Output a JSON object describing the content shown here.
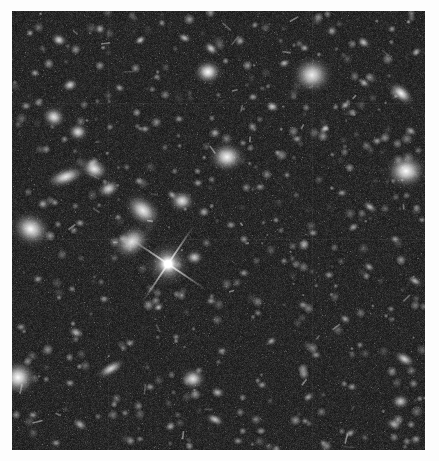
{
  "image": {
    "kind": "astronomical-deep-field-photograph",
    "title": "Deep Field",
    "description": "Dark sky field densely populated with faint and bright galaxies of varied morphology, plus one prominent foreground star with four-point diffraction spikes left of centre.",
    "border": {
      "color": "#ffffff",
      "left": 12,
      "top": 11,
      "right": 14,
      "bottom": 11
    },
    "canvas": {
      "width": 439,
      "height": 461
    },
    "field": {
      "x": 12,
      "y": 11,
      "width": 413,
      "height": 439
    },
    "background_color": "#1b1b1b",
    "noise_color_low": "#111111",
    "noise_color_high": "#3a3a3a",
    "object_color": "#f2f2f2",
    "grain_density": 2600,
    "faint_dot_count": 420,
    "seams": {
      "horizontal_y": [
        92,
        228
      ],
      "vertical_x": [
        96,
        300
      ],
      "color": "rgba(255,255,255,0.045)"
    },
    "bright_star": {
      "name": "foreground-star-with-diffraction-spikes",
      "x": 156,
      "y": 253,
      "core_radius": 7,
      "halo_radius": 22,
      "spike_length": 46,
      "spike_angle_deg": 34,
      "color": "#ffffff"
    },
    "objects": [
      {
        "x": 18,
        "y": 22,
        "w": 5,
        "h": 5,
        "rot": 0,
        "b": 0.55,
        "type": "point"
      },
      {
        "x": 47,
        "y": 29,
        "w": 9,
        "h": 7,
        "rot": 20,
        "b": 0.8,
        "type": "elliptical"
      },
      {
        "x": 88,
        "y": 18,
        "w": 6,
        "h": 6,
        "rot": 0,
        "b": 0.62,
        "type": "point"
      },
      {
        "x": 128,
        "y": 29,
        "w": 7,
        "h": 5,
        "rot": 150,
        "b": 0.74,
        "type": "elliptical"
      },
      {
        "x": 150,
        "y": 12,
        "w": 5,
        "h": 5,
        "rot": 0,
        "b": 0.5,
        "type": "point"
      },
      {
        "x": 173,
        "y": 27,
        "w": 8,
        "h": 5,
        "rot": 25,
        "b": 0.7,
        "type": "elliptical"
      },
      {
        "x": 199,
        "y": 38,
        "w": 9,
        "h": 6,
        "rot": 40,
        "b": 0.78,
        "type": "elliptical"
      },
      {
        "x": 228,
        "y": 30,
        "w": 6,
        "h": 6,
        "rot": 0,
        "b": 0.58,
        "type": "point"
      },
      {
        "x": 243,
        "y": 14,
        "w": 5,
        "h": 4,
        "rot": 0,
        "b": 0.48,
        "type": "point"
      },
      {
        "x": 196,
        "y": 61,
        "w": 15,
        "h": 13,
        "rot": 0,
        "b": 1.0,
        "type": "star"
      },
      {
        "x": 272,
        "y": 52,
        "w": 7,
        "h": 5,
        "rot": 160,
        "b": 0.66,
        "type": "elliptical"
      },
      {
        "x": 293,
        "y": 37,
        "w": 6,
        "h": 5,
        "rot": 10,
        "b": 0.6,
        "type": "elliptical"
      },
      {
        "x": 320,
        "y": 20,
        "w": 6,
        "h": 6,
        "rot": 0,
        "b": 0.55,
        "type": "point"
      },
      {
        "x": 352,
        "y": 32,
        "w": 8,
        "h": 6,
        "rot": 35,
        "b": 0.72,
        "type": "elliptical"
      },
      {
        "x": 380,
        "y": 18,
        "w": 5,
        "h": 5,
        "rot": 0,
        "b": 0.52,
        "type": "point"
      },
      {
        "x": 404,
        "y": 41,
        "w": 7,
        "h": 5,
        "rot": 140,
        "b": 0.64,
        "type": "elliptical"
      },
      {
        "x": 300,
        "y": 64,
        "w": 22,
        "h": 20,
        "rot": 0,
        "b": 0.92,
        "type": "diffuse"
      },
      {
        "x": 352,
        "y": 72,
        "w": 7,
        "h": 5,
        "rot": 30,
        "b": 0.66,
        "type": "elliptical"
      },
      {
        "x": 23,
        "y": 62,
        "w": 6,
        "h": 5,
        "rot": 0,
        "b": 0.56,
        "type": "elliptical"
      },
      {
        "x": 58,
        "y": 74,
        "w": 9,
        "h": 7,
        "rot": 155,
        "b": 0.78,
        "type": "elliptical"
      },
      {
        "x": 108,
        "y": 77,
        "w": 6,
        "h": 5,
        "rot": 20,
        "b": 0.56,
        "type": "elliptical"
      },
      {
        "x": 145,
        "y": 66,
        "w": 5,
        "h": 4,
        "rot": 0,
        "b": 0.48,
        "type": "point"
      },
      {
        "x": 241,
        "y": 86,
        "w": 6,
        "h": 5,
        "rot": 0,
        "b": 0.56,
        "type": "point"
      },
      {
        "x": 261,
        "y": 96,
        "w": 8,
        "h": 6,
        "rot": 25,
        "b": 0.7,
        "type": "elliptical"
      },
      {
        "x": 333,
        "y": 94,
        "w": 7,
        "h": 5,
        "rot": 150,
        "b": 0.62,
        "type": "elliptical"
      },
      {
        "x": 389,
        "y": 83,
        "w": 16,
        "h": 9,
        "rot": 40,
        "b": 0.96,
        "type": "spiral"
      },
      {
        "x": 418,
        "y": 104,
        "w": 7,
        "h": 6,
        "rot": 0,
        "b": 0.62,
        "type": "elliptical"
      },
      {
        "x": 14,
        "y": 95,
        "w": 6,
        "h": 5,
        "rot": 0,
        "b": 0.52,
        "type": "point"
      },
      {
        "x": 42,
        "y": 106,
        "w": 13,
        "h": 11,
        "rot": 25,
        "b": 0.88,
        "type": "elliptical"
      },
      {
        "x": 66,
        "y": 121,
        "w": 11,
        "h": 10,
        "rot": 0,
        "b": 0.86,
        "type": "elliptical"
      },
      {
        "x": 98,
        "y": 116,
        "w": 5,
        "h": 4,
        "rot": 0,
        "b": 0.46,
        "type": "point"
      },
      {
        "x": 133,
        "y": 118,
        "w": 6,
        "h": 5,
        "rot": 0,
        "b": 0.52,
        "type": "point"
      },
      {
        "x": 167,
        "y": 108,
        "w": 6,
        "h": 5,
        "rot": 0,
        "b": 0.5,
        "type": "point"
      },
      {
        "x": 203,
        "y": 122,
        "w": 7,
        "h": 6,
        "rot": 0,
        "b": 0.6,
        "type": "elliptical"
      },
      {
        "x": 231,
        "y": 132,
        "w": 5,
        "h": 4,
        "rot": 0,
        "b": 0.46,
        "type": "point"
      },
      {
        "x": 285,
        "y": 128,
        "w": 6,
        "h": 5,
        "rot": 0,
        "b": 0.54,
        "type": "point"
      },
      {
        "x": 312,
        "y": 118,
        "w": 7,
        "h": 5,
        "rot": 145,
        "b": 0.6,
        "type": "elliptical"
      },
      {
        "x": 365,
        "y": 130,
        "w": 6,
        "h": 5,
        "rot": 0,
        "b": 0.54,
        "type": "point"
      },
      {
        "x": 399,
        "y": 120,
        "w": 7,
        "h": 5,
        "rot": 30,
        "b": 0.58,
        "type": "elliptical"
      },
      {
        "x": 215,
        "y": 146,
        "w": 19,
        "h": 16,
        "rot": 0,
        "b": 0.97,
        "type": "elliptical"
      },
      {
        "x": 394,
        "y": 160,
        "w": 22,
        "h": 19,
        "rot": 0,
        "b": 1.0,
        "type": "elliptical"
      },
      {
        "x": 54,
        "y": 166,
        "w": 22,
        "h": 10,
        "rot": 160,
        "b": 0.9,
        "type": "spiral"
      },
      {
        "x": 82,
        "y": 158,
        "w": 16,
        "h": 12,
        "rot": 25,
        "b": 0.92,
        "type": "spiral"
      },
      {
        "x": 97,
        "y": 178,
        "w": 13,
        "h": 9,
        "rot": 155,
        "b": 0.8,
        "type": "elliptical"
      },
      {
        "x": 31,
        "y": 193,
        "w": 7,
        "h": 6,
        "rot": 0,
        "b": 0.58,
        "type": "elliptical"
      },
      {
        "x": 127,
        "y": 170,
        "w": 6,
        "h": 5,
        "rot": 0,
        "b": 0.52,
        "type": "point"
      },
      {
        "x": 160,
        "y": 184,
        "w": 7,
        "h": 5,
        "rot": 40,
        "b": 0.6,
        "type": "elliptical"
      },
      {
        "x": 186,
        "y": 172,
        "w": 6,
        "h": 5,
        "rot": 0,
        "b": 0.54,
        "type": "point"
      },
      {
        "x": 248,
        "y": 176,
        "w": 6,
        "h": 5,
        "rot": 0,
        "b": 0.52,
        "type": "point"
      },
      {
        "x": 275,
        "y": 164,
        "w": 5,
        "h": 4,
        "rot": 0,
        "b": 0.46,
        "type": "point"
      },
      {
        "x": 330,
        "y": 182,
        "w": 6,
        "h": 5,
        "rot": 0,
        "b": 0.52,
        "type": "point"
      },
      {
        "x": 358,
        "y": 196,
        "w": 9,
        "h": 5,
        "rot": 35,
        "b": 0.66,
        "type": "elliptical"
      },
      {
        "x": 19,
        "y": 218,
        "w": 22,
        "h": 18,
        "rot": 25,
        "b": 0.95,
        "type": "diffuse"
      },
      {
        "x": 68,
        "y": 212,
        "w": 6,
        "h": 5,
        "rot": 0,
        "b": 0.54,
        "type": "point"
      },
      {
        "x": 106,
        "y": 206,
        "w": 5,
        "h": 4,
        "rot": 0,
        "b": 0.46,
        "type": "point"
      },
      {
        "x": 131,
        "y": 199,
        "w": 22,
        "h": 15,
        "rot": 40,
        "b": 0.93,
        "type": "spiral"
      },
      {
        "x": 170,
        "y": 190,
        "w": 14,
        "h": 12,
        "rot": 0,
        "b": 0.88,
        "type": "elliptical"
      },
      {
        "x": 192,
        "y": 201,
        "w": 7,
        "h": 6,
        "rot": 0,
        "b": 0.6,
        "type": "elliptical"
      },
      {
        "x": 219,
        "y": 214,
        "w": 6,
        "h": 5,
        "rot": 0,
        "b": 0.52,
        "type": "point"
      },
      {
        "x": 264,
        "y": 209,
        "w": 5,
        "h": 4,
        "rot": 0,
        "b": 0.46,
        "type": "point"
      },
      {
        "x": 301,
        "y": 222,
        "w": 6,
        "h": 5,
        "rot": 0,
        "b": 0.52,
        "type": "point"
      },
      {
        "x": 341,
        "y": 216,
        "w": 7,
        "h": 5,
        "rot": 150,
        "b": 0.58,
        "type": "elliptical"
      },
      {
        "x": 383,
        "y": 228,
        "w": 6,
        "h": 5,
        "rot": 0,
        "b": 0.52,
        "type": "point"
      },
      {
        "x": 410,
        "y": 209,
        "w": 5,
        "h": 4,
        "rot": 0,
        "b": 0.46,
        "type": "point"
      },
      {
        "x": 120,
        "y": 231,
        "w": 22,
        "h": 16,
        "rot": 145,
        "b": 0.88,
        "type": "spiral"
      },
      {
        "x": 182,
        "y": 246,
        "w": 10,
        "h": 8,
        "rot": 0,
        "b": 0.76,
        "type": "elliptical"
      },
      {
        "x": 232,
        "y": 262,
        "w": 6,
        "h": 5,
        "rot": 0,
        "b": 0.52,
        "type": "point"
      },
      {
        "x": 272,
        "y": 250,
        "w": 5,
        "h": 4,
        "rot": 0,
        "b": 0.46,
        "type": "point"
      },
      {
        "x": 317,
        "y": 264,
        "w": 6,
        "h": 5,
        "rot": 0,
        "b": 0.52,
        "type": "point"
      },
      {
        "x": 357,
        "y": 256,
        "w": 7,
        "h": 5,
        "rot": 35,
        "b": 0.58,
        "type": "elliptical"
      },
      {
        "x": 403,
        "y": 270,
        "w": 9,
        "h": 5,
        "rot": 30,
        "b": 0.66,
        "type": "elliptical"
      },
      {
        "x": 26,
        "y": 268,
        "w": 6,
        "h": 5,
        "rot": 0,
        "b": 0.52,
        "type": "point"
      },
      {
        "x": 60,
        "y": 278,
        "w": 5,
        "h": 4,
        "rot": 0,
        "b": 0.44,
        "type": "point"
      },
      {
        "x": 92,
        "y": 288,
        "w": 6,
        "h": 5,
        "rot": 0,
        "b": 0.5,
        "type": "point"
      },
      {
        "x": 146,
        "y": 296,
        "w": 7,
        "h": 5,
        "rot": 150,
        "b": 0.58,
        "type": "elliptical"
      },
      {
        "x": 199,
        "y": 290,
        "w": 6,
        "h": 5,
        "rot": 0,
        "b": 0.52,
        "type": "point"
      },
      {
        "x": 246,
        "y": 302,
        "w": 5,
        "h": 4,
        "rot": 0,
        "b": 0.46,
        "type": "point"
      },
      {
        "x": 291,
        "y": 294,
        "w": 6,
        "h": 5,
        "rot": 0,
        "b": 0.52,
        "type": "point"
      },
      {
        "x": 333,
        "y": 308,
        "w": 7,
        "h": 5,
        "rot": 30,
        "b": 0.58,
        "type": "elliptical"
      },
      {
        "x": 379,
        "y": 298,
        "w": 5,
        "h": 4,
        "rot": 0,
        "b": 0.46,
        "type": "point"
      },
      {
        "x": 9,
        "y": 316,
        "w": 6,
        "h": 5,
        "rot": 0,
        "b": 0.5,
        "type": "point"
      },
      {
        "x": 64,
        "y": 322,
        "w": 9,
        "h": 6,
        "rot": 25,
        "b": 0.66,
        "type": "elliptical"
      },
      {
        "x": 118,
        "y": 332,
        "w": 6,
        "h": 5,
        "rot": 0,
        "b": 0.52,
        "type": "point"
      },
      {
        "x": 164,
        "y": 326,
        "w": 5,
        "h": 4,
        "rot": 0,
        "b": 0.46,
        "type": "point"
      },
      {
        "x": 210,
        "y": 340,
        "w": 6,
        "h": 5,
        "rot": 0,
        "b": 0.52,
        "type": "point"
      },
      {
        "x": 259,
        "y": 330,
        "w": 7,
        "h": 5,
        "rot": 150,
        "b": 0.58,
        "type": "elliptical"
      },
      {
        "x": 304,
        "y": 344,
        "w": 6,
        "h": 5,
        "rot": 0,
        "b": 0.52,
        "type": "point"
      },
      {
        "x": 348,
        "y": 334,
        "w": 5,
        "h": 4,
        "rot": 0,
        "b": 0.46,
        "type": "point"
      },
      {
        "x": 392,
        "y": 348,
        "w": 12,
        "h": 7,
        "rot": 30,
        "b": 0.8,
        "type": "spiral"
      },
      {
        "x": 6,
        "y": 366,
        "w": 20,
        "h": 19,
        "rot": 0,
        "b": 1.0,
        "type": "star"
      },
      {
        "x": 58,
        "y": 372,
        "w": 6,
        "h": 5,
        "rot": 0,
        "b": 0.52,
        "type": "point"
      },
      {
        "x": 99,
        "y": 358,
        "w": 17,
        "h": 7,
        "rot": 150,
        "b": 0.82,
        "type": "spiral"
      },
      {
        "x": 138,
        "y": 376,
        "w": 6,
        "h": 5,
        "rot": 0,
        "b": 0.52,
        "type": "point"
      },
      {
        "x": 181,
        "y": 368,
        "w": 14,
        "h": 12,
        "rot": 0,
        "b": 0.88,
        "type": "elliptical"
      },
      {
        "x": 206,
        "y": 382,
        "w": 8,
        "h": 6,
        "rot": 20,
        "b": 0.66,
        "type": "elliptical"
      },
      {
        "x": 250,
        "y": 374,
        "w": 6,
        "h": 5,
        "rot": 0,
        "b": 0.52,
        "type": "point"
      },
      {
        "x": 296,
        "y": 386,
        "w": 7,
        "h": 5,
        "rot": 150,
        "b": 0.58,
        "type": "elliptical"
      },
      {
        "x": 340,
        "y": 376,
        "w": 6,
        "h": 5,
        "rot": 0,
        "b": 0.52,
        "type": "point"
      },
      {
        "x": 388,
        "y": 390,
        "w": 10,
        "h": 8,
        "rot": 0,
        "b": 0.74,
        "type": "elliptical"
      },
      {
        "x": 21,
        "y": 404,
        "w": 6,
        "h": 5,
        "rot": 0,
        "b": 0.52,
        "type": "point"
      },
      {
        "x": 68,
        "y": 414,
        "w": 9,
        "h": 6,
        "rot": 30,
        "b": 0.64,
        "type": "elliptical"
      },
      {
        "x": 113,
        "y": 402,
        "w": 5,
        "h": 4,
        "rot": 0,
        "b": 0.46,
        "type": "point"
      },
      {
        "x": 158,
        "y": 416,
        "w": 6,
        "h": 5,
        "rot": 0,
        "b": 0.52,
        "type": "point"
      },
      {
        "x": 203,
        "y": 408,
        "w": 11,
        "h": 6,
        "rot": 25,
        "b": 0.74,
        "type": "spiral"
      },
      {
        "x": 249,
        "y": 420,
        "w": 6,
        "h": 5,
        "rot": 0,
        "b": 0.52,
        "type": "point"
      },
      {
        "x": 293,
        "y": 410,
        "w": 5,
        "h": 4,
        "rot": 0,
        "b": 0.46,
        "type": "point"
      },
      {
        "x": 338,
        "y": 422,
        "w": 7,
        "h": 5,
        "rot": 150,
        "b": 0.58,
        "type": "elliptical"
      },
      {
        "x": 382,
        "y": 414,
        "w": 9,
        "h": 6,
        "rot": 30,
        "b": 0.66,
        "type": "elliptical"
      },
      {
        "x": 44,
        "y": 432,
        "w": 6,
        "h": 5,
        "rot": 0,
        "b": 0.5,
        "type": "point"
      },
      {
        "x": 128,
        "y": 428,
        "w": 5,
        "h": 4,
        "rot": 0,
        "b": 0.44,
        "type": "point"
      },
      {
        "x": 226,
        "y": 430,
        "w": 6,
        "h": 5,
        "rot": 0,
        "b": 0.5,
        "type": "point"
      },
      {
        "x": 311,
        "y": 432,
        "w": 5,
        "h": 4,
        "rot": 0,
        "b": 0.44,
        "type": "point"
      },
      {
        "x": 404,
        "y": 428,
        "w": 6,
        "h": 5,
        "rot": 0,
        "b": 0.5,
        "type": "point"
      }
    ]
  }
}
